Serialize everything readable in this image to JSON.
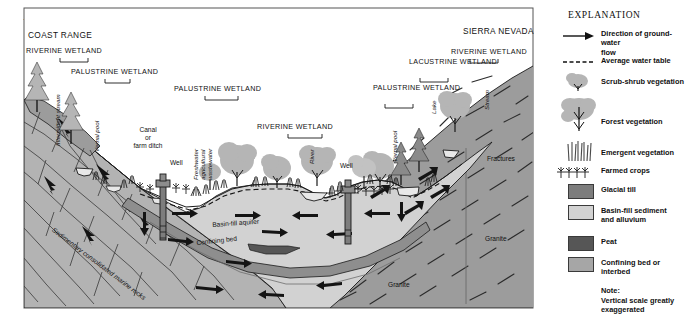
{
  "figure": {
    "label_prefix": "A.",
    "title": "Central Valley"
  },
  "diagram": {
    "ranges": [
      {
        "name": "coast-range",
        "text": "COAST RANGE"
      },
      {
        "name": "sierra-nevada",
        "text": "SIERRA NEVADA"
      }
    ],
    "wetland_labels": [
      {
        "name": "riverine-wetland-left",
        "text": "RIVERINE WETLAND"
      },
      {
        "name": "palustrine-wetland-left",
        "text": "PALUSTRINE WETLAND"
      },
      {
        "name": "palustrine-wetland-center",
        "text": "PALUSTRINE WETLAND"
      },
      {
        "name": "riverine-wetland-center",
        "text": "RIVERINE WETLAND"
      },
      {
        "name": "palustrine-wetland-right",
        "text": "PALUSTRINE\nWETLAND"
      },
      {
        "name": "lacustrine-wetland",
        "text": "LACUSTRINE\nWETLAND"
      },
      {
        "name": "riverine-wetland-right",
        "text": "RIVERINE WETLAND"
      }
    ],
    "feature_labels": [
      {
        "name": "intermittent-stream",
        "text": "Intermittent stream"
      },
      {
        "name": "vernal-pool-left",
        "text": "Vernal pool"
      },
      {
        "name": "canal-or-farm-ditch",
        "text": "Canal\nor\nfarm ditch"
      },
      {
        "name": "well-left",
        "text": "Well"
      },
      {
        "name": "freshwater-agricultural-wastewater",
        "text": "Freshwater\nagricultural\nwastewater"
      },
      {
        "name": "river",
        "text": "River"
      },
      {
        "name": "well-right",
        "text": "Well"
      },
      {
        "name": "vernal-pool-right",
        "text": "Vernal pool"
      },
      {
        "name": "lake",
        "text": "Lake"
      },
      {
        "name": "stream",
        "text": "Stream"
      },
      {
        "name": "fractures",
        "text": "Fractures"
      }
    ],
    "unit_labels": [
      {
        "name": "sedimentary-consolidated-marine-rocks",
        "text": "Sedimentary consolidated marine rocks"
      },
      {
        "name": "basin-fill-aquifer",
        "text": "Basin-fill aquifer"
      },
      {
        "name": "confining-bed",
        "text": "Confining bed"
      },
      {
        "name": "granite-left",
        "text": "Granite"
      },
      {
        "name": "granite-right",
        "text": "Granite"
      }
    ]
  },
  "legend": {
    "title": "EXPLANATION",
    "items": [
      {
        "name": "direction-of-ground-water-flow",
        "symbol": "arrow",
        "text": "Direction of ground-water\n    flow"
      },
      {
        "name": "average-water-table",
        "symbol": "dashed-line",
        "text": "Average water table"
      },
      {
        "name": "scrub-shrub-vegetation",
        "symbol": "scrub-shrub",
        "text": "Scrub-shrub vegetation"
      },
      {
        "name": "forest-vegetation",
        "symbol": "forest",
        "text": "Forest vegetation"
      },
      {
        "name": "emergent-vegetation",
        "symbol": "emergent",
        "text": "Emergent vegetation"
      },
      {
        "name": "farmed-crops",
        "symbol": "crops",
        "text": "Farmed crops"
      },
      {
        "name": "glacial-till",
        "symbol": "swatch",
        "text": "Glacial till",
        "color": "#7d7d7d"
      },
      {
        "name": "basin-fill-sediment-and-alluvium",
        "symbol": "swatch",
        "text": "Basin-fill sediment\n    and alluvium",
        "color": "#d2d2d2"
      },
      {
        "name": "peat",
        "symbol": "swatch",
        "text": "Peat",
        "color": "#565656"
      },
      {
        "name": "confining-bed-or-interbed",
        "symbol": "swatch",
        "text": "Confining bed or\n    interbed",
        "color": "#a6a6a6"
      }
    ],
    "note_heading": "Note:",
    "note_body": "Vertical scale greatly\n    exaggerated"
  },
  "colors": {
    "basin_fill": "#d2d2d2",
    "confining_bed": "#a6a6a6",
    "bedrock": "#9c9c9c",
    "marine_rock": "#b3b3b3",
    "vegetation": "#b5b5b5",
    "water": "#e8e8e8",
    "outline": "#1a1a1a"
  }
}
